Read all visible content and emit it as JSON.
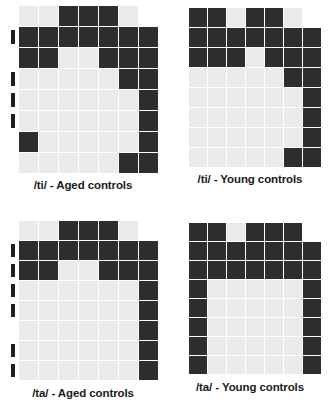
{
  "figure": {
    "legend": {
      "empty": "no response",
      "light": "low / near-zero proportion",
      "dark": "high proportion"
    },
    "colors": {
      "background": "#ffffff",
      "light_cell": "#eaeaea",
      "dark_cell": "#2e2e2e",
      "marker": "#1f1f1f",
      "caption_text": "#1a1a1a"
    },
    "grid": {
      "rows": 8,
      "data_columns": 7,
      "marker_column": 1,
      "value_key": {
        "0": "blank",
        "1": "light",
        "2": "dark"
      }
    }
  },
  "chart_data": {
    "type": "heatmap",
    "xlabel": "",
    "ylabel": "",
    "grid": true,
    "legend_position": "none",
    "value_levels": [
      0,
      1,
      2
    ],
    "value_level_labels": [
      "blank",
      "light",
      "dark"
    ],
    "panels": [
      {
        "id": "ti-aged",
        "caption": "/ti/ - Aged controls",
        "position": "top-left",
        "markers": [
          0,
          1,
          0,
          1,
          1,
          1,
          0,
          0
        ],
        "matrix": [
          [
            1,
            1,
            2,
            2,
            2,
            1,
            0
          ],
          [
            2,
            2,
            2,
            2,
            2,
            2,
            2
          ],
          [
            2,
            2,
            1,
            1,
            2,
            2,
            2
          ],
          [
            1,
            1,
            1,
            1,
            1,
            2,
            2
          ],
          [
            1,
            1,
            1,
            1,
            1,
            1,
            2
          ],
          [
            1,
            1,
            1,
            1,
            1,
            1,
            2
          ],
          [
            2,
            1,
            1,
            1,
            1,
            1,
            2
          ],
          [
            1,
            1,
            1,
            1,
            1,
            2,
            2
          ]
        ]
      },
      {
        "id": "ti-young",
        "caption": "/ti/ - Young controls",
        "position": "top-right",
        "markers": [
          0,
          0,
          0,
          0,
          0,
          0,
          0,
          0
        ],
        "matrix": [
          [
            2,
            2,
            1,
            2,
            2,
            1,
            0
          ],
          [
            2,
            2,
            2,
            2,
            2,
            2,
            2
          ],
          [
            2,
            2,
            2,
            1,
            2,
            2,
            2
          ],
          [
            1,
            1,
            1,
            1,
            1,
            2,
            2
          ],
          [
            1,
            1,
            1,
            1,
            1,
            1,
            2
          ],
          [
            1,
            1,
            1,
            1,
            1,
            1,
            2
          ],
          [
            1,
            1,
            1,
            1,
            1,
            1,
            2
          ],
          [
            1,
            1,
            1,
            1,
            1,
            2,
            2
          ]
        ]
      },
      {
        "id": "ta-aged",
        "caption": "/ta/ - Aged controls",
        "position": "bottom-left",
        "markers": [
          0,
          1,
          1,
          1,
          1,
          0,
          1,
          1
        ],
        "matrix": [
          [
            1,
            1,
            2,
            2,
            2,
            1,
            0
          ],
          [
            2,
            2,
            2,
            2,
            2,
            2,
            2
          ],
          [
            2,
            2,
            1,
            1,
            2,
            2,
            2
          ],
          [
            1,
            1,
            1,
            1,
            1,
            1,
            2
          ],
          [
            1,
            1,
            1,
            1,
            1,
            1,
            2
          ],
          [
            1,
            1,
            1,
            1,
            1,
            1,
            2
          ],
          [
            1,
            1,
            1,
            1,
            1,
            1,
            2
          ],
          [
            1,
            1,
            1,
            1,
            1,
            1,
            2
          ]
        ]
      },
      {
        "id": "ta-young",
        "caption": "/ta/ - Young controls",
        "position": "bottom-right",
        "markers": [
          0,
          0,
          0,
          0,
          0,
          0,
          0,
          0
        ],
        "matrix": [
          [
            2,
            2,
            1,
            2,
            2,
            2,
            0
          ],
          [
            2,
            2,
            2,
            2,
            2,
            2,
            2
          ],
          [
            2,
            2,
            2,
            2,
            2,
            2,
            2
          ],
          [
            2,
            1,
            1,
            1,
            1,
            1,
            2
          ],
          [
            2,
            1,
            1,
            1,
            1,
            1,
            2
          ],
          [
            2,
            1,
            1,
            1,
            1,
            1,
            2
          ],
          [
            2,
            1,
            1,
            1,
            1,
            1,
            2
          ],
          [
            2,
            1,
            1,
            1,
            1,
            1,
            2
          ]
        ]
      }
    ]
  }
}
